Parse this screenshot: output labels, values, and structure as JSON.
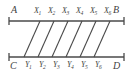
{
  "figure": {
    "type": "geometry-diagram",
    "ink_color": "#4a4a4a",
    "background_color": "#ffffff",
    "lines": {
      "top": {
        "name": "line-AB",
        "start_label": "A",
        "end_label": "B",
        "x1": 9,
        "x2": 124,
        "y": 21
      },
      "bottom": {
        "name": "line-CD",
        "start_label": "C",
        "end_label": "D",
        "x1": 9,
        "x2": 124,
        "y": 57
      }
    },
    "corner_labels": [
      {
        "text": "A",
        "x": 11,
        "y": 5
      },
      {
        "text": "B",
        "x": 113,
        "y": 5
      },
      {
        "text": "C",
        "x": 10,
        "y": 61
      },
      {
        "text": "D",
        "x": 113,
        "y": 61
      }
    ],
    "transversals": [
      {
        "name": "transversal-1",
        "x_top": 40,
        "x_bottom": 24
      },
      {
        "name": "transversal-2",
        "x_top": 54,
        "x_bottom": 38
      },
      {
        "name": "transversal-3",
        "x_top": 68,
        "x_bottom": 52
      },
      {
        "name": "transversal-4",
        "x_top": 82,
        "x_bottom": 66
      },
      {
        "name": "transversal-5",
        "x_top": 96,
        "x_bottom": 80
      },
      {
        "name": "transversal-6",
        "x_top": 110,
        "x_bottom": 94
      }
    ],
    "top_nodes": [
      {
        "base": "X",
        "sub": "1",
        "x": 34,
        "y": 7
      },
      {
        "base": "X",
        "sub": "2",
        "x": 48,
        "y": 7
      },
      {
        "base": "X",
        "sub": "3",
        "x": 62,
        "y": 7
      },
      {
        "base": "X",
        "sub": "4",
        "x": 76,
        "y": 7
      },
      {
        "base": "X",
        "sub": "5",
        "x": 90,
        "y": 7
      },
      {
        "base": "X",
        "sub": "6",
        "x": 104,
        "y": 7
      }
    ],
    "bottom_nodes": [
      {
        "base": "Y",
        "sub": "1",
        "x": 25,
        "y": 61
      },
      {
        "base": "Y",
        "sub": "2",
        "x": 39,
        "y": 61
      },
      {
        "base": "Y",
        "sub": "3",
        "x": 53,
        "y": 61
      },
      {
        "base": "Y",
        "sub": "4",
        "x": 67,
        "y": 61
      },
      {
        "base": "Y",
        "sub": "5",
        "x": 81,
        "y": 61
      },
      {
        "base": "Y",
        "sub": "6",
        "x": 95,
        "y": 61
      }
    ],
    "end_ticks": [
      {
        "name": "tick-A",
        "x": 9,
        "y": 21
      },
      {
        "name": "tick-B",
        "x": 124,
        "y": 21
      },
      {
        "name": "tick-C",
        "x": 9,
        "y": 57
      },
      {
        "name": "tick-D",
        "x": 124,
        "y": 57
      }
    ]
  }
}
